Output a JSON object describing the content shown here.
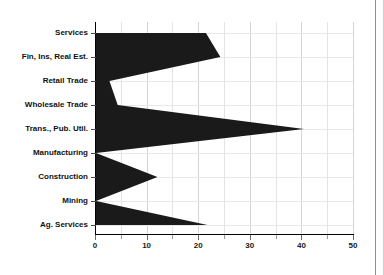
{
  "chart_data": {
    "type": "area",
    "orientation": "horizontal",
    "title": "",
    "subtitle": "",
    "xlabel": "",
    "ylabel": "",
    "xlim": [
      0,
      50
    ],
    "ylim": null,
    "grid": true,
    "legend": false,
    "legend_position": "none",
    "series_color": "#1a1a1a",
    "background_color": "#ffffff",
    "gridline_color": "#d4d4d4",
    "axis_color": "#000000",
    "categories": [
      "Services",
      "Fin, Ins, Real Est.",
      "Retail Trade",
      "Wholesale Trade",
      "Trans., Pub. Util.",
      "Manufacturing",
      "Construction",
      "Mining",
      "Ag. Services"
    ],
    "values": [
      21.5,
      24.3,
      2.8,
      4.4,
      40.5,
      0.2,
      12.1,
      0.2,
      21.8
    ],
    "xticks": [
      0,
      5,
      10,
      15,
      20,
      25,
      30,
      35,
      40,
      45,
      50
    ],
    "xtick_labels": [
      "0",
      "",
      "10",
      "",
      "20",
      "",
      "30",
      "",
      "40",
      "",
      "50"
    ],
    "xtick_major": [
      0,
      10,
      20,
      30,
      40,
      50
    ],
    "xtick_minor": [
      5,
      15,
      25,
      35,
      45
    ]
  }
}
